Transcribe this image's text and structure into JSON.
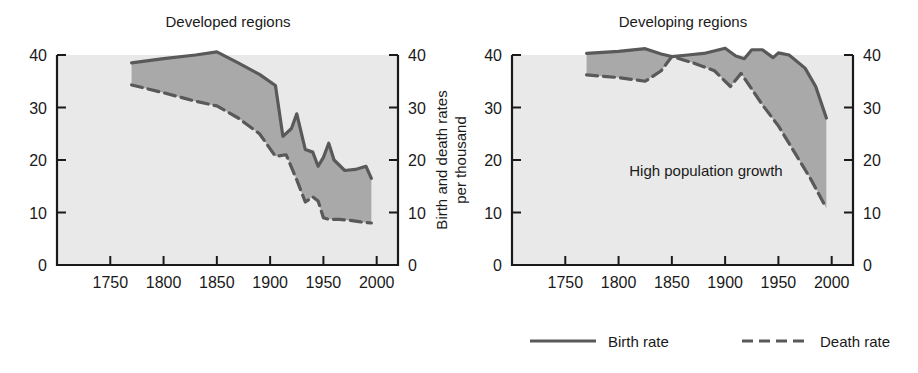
{
  "figure": {
    "width": 918,
    "height": 373,
    "background": "#ffffff",
    "band_color": "#a9a9a9",
    "plot_background": "#e9e9e9",
    "line_color": "#595959",
    "axis_color": "#1a1a1a"
  },
  "shared": {
    "ylabel_line1": "Birth and death rates",
    "ylabel_line2": "per thousand",
    "xticks": [
      "1750",
      "1800",
      "1850",
      "1900",
      "1950",
      "2000"
    ],
    "yticks": [
      "0",
      "10",
      "20",
      "30",
      "40"
    ],
    "ylim": [
      0,
      40
    ],
    "xlim": [
      1700,
      2020
    ]
  },
  "legend": {
    "position": "bottom-right",
    "items": [
      {
        "label": "Birth rate",
        "style": "solid"
      },
      {
        "label": "Death rate",
        "style": "dashed"
      }
    ]
  },
  "chart_data": [
    {
      "type": "area",
      "title": "Developed regions",
      "panel": "left",
      "xlabel": "",
      "ylabel": "Birth and death rates per thousand",
      "xlim": [
        1700,
        2020
      ],
      "ylim": [
        0,
        40
      ],
      "xticks": [
        1750,
        1800,
        1850,
        1900,
        1950,
        2000
      ],
      "yticks": [
        0,
        10,
        20,
        30,
        40
      ],
      "grid": false,
      "legend_position": "bottom-right",
      "annotations": [],
      "series": [
        {
          "name": "Birth rate",
          "style": "solid",
          "x": [
            1770,
            1800,
            1830,
            1850,
            1870,
            1890,
            1905,
            1912,
            1920,
            1925,
            1933,
            1940,
            1945,
            1950,
            1955,
            1960,
            1970,
            1980,
            1990,
            1995
          ],
          "values": [
            38.5,
            39.3,
            40.0,
            40.6,
            38.5,
            36.3,
            34.2,
            24.5,
            26.0,
            28.8,
            22.0,
            21.5,
            18.8,
            20.5,
            23.2,
            20.0,
            18.0,
            18.2,
            18.8,
            16.5
          ]
        },
        {
          "name": "Death rate",
          "style": "dashed",
          "x": [
            1770,
            1800,
            1830,
            1850,
            1870,
            1890,
            1905,
            1915,
            1925,
            1933,
            1940,
            1945,
            1950,
            1955,
            1965,
            1975,
            1985,
            1995
          ],
          "values": [
            34.3,
            32.8,
            31.2,
            30.3,
            28.0,
            25.0,
            20.7,
            21.0,
            16.2,
            12.0,
            13.0,
            12.2,
            9.0,
            8.7,
            8.7,
            8.5,
            8.2,
            8.0
          ]
        }
      ]
    },
    {
      "type": "area",
      "title": "Developing regions",
      "panel": "right",
      "xlabel": "",
      "ylabel": "Birth and death rates per thousand",
      "xlim": [
        1700,
        2020
      ],
      "ylim": [
        0,
        40
      ],
      "xticks": [
        1750,
        1800,
        1850,
        1900,
        1950,
        2000
      ],
      "yticks": [
        0,
        10,
        20,
        30,
        40
      ],
      "grid": false,
      "legend_position": "bottom-right",
      "annotations": [
        {
          "text": "High population growth",
          "x": 1810,
          "y": 17
        }
      ],
      "series": [
        {
          "name": "Birth rate",
          "style": "solid",
          "x": [
            1770,
            1800,
            1825,
            1840,
            1850,
            1865,
            1880,
            1900,
            1910,
            1918,
            1925,
            1935,
            1945,
            1950,
            1960,
            1975,
            1985,
            1995
          ],
          "values": [
            40.3,
            40.7,
            41.2,
            40.2,
            39.7,
            40.0,
            40.3,
            41.3,
            39.8,
            39.3,
            41.0,
            41.0,
            39.5,
            40.4,
            40.0,
            37.5,
            34.0,
            28.0
          ]
        },
        {
          "name": "Death rate",
          "style": "dashed",
          "x": [
            1770,
            1800,
            1825,
            1840,
            1850,
            1870,
            1890,
            1905,
            1915,
            1925,
            1935,
            1950,
            1965,
            1980,
            1995
          ],
          "values": [
            36.2,
            35.7,
            35.0,
            37.0,
            39.7,
            38.5,
            37.0,
            34.0,
            36.5,
            33.5,
            30.5,
            26.5,
            21.5,
            16.5,
            10.8
          ]
        }
      ]
    }
  ]
}
